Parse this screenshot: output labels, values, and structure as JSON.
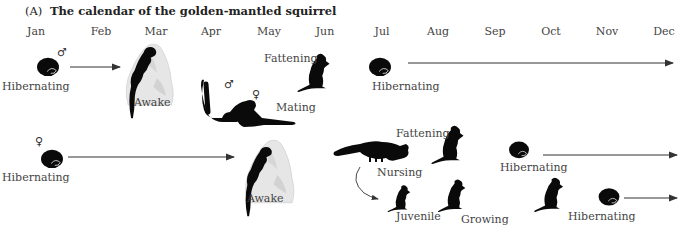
{
  "figure": {
    "panel_label": "(A)",
    "title": "The calendar of the golden-mantled squirrel"
  },
  "months": [
    "Jan",
    "Feb",
    "Mar",
    "Apr",
    "May",
    "Jun",
    "Jul",
    "Aug",
    "Sep",
    "Oct",
    "Nov",
    "Dec"
  ],
  "male_row": {
    "sex_symbol": "♂",
    "stages": {
      "hibernating_start": "Hibernating",
      "awake": "Awake",
      "mating": "Mating",
      "fattening": "Fattening",
      "hibernating_end": "Hibernating"
    },
    "mating_symbols": {
      "male": "♂",
      "female": "♀"
    }
  },
  "female_row": {
    "sex_symbol": "♀",
    "stages": {
      "hibernating_start": "Hibernating",
      "awake": "Awake",
      "nursing": "Nursing",
      "fattening": "Fattening",
      "hibernating_end": "Hibernating"
    }
  },
  "juvenile_row": {
    "stages": {
      "juvenile": "Juvenile",
      "growing": "Growing",
      "hibernating": "Hibernating"
    }
  },
  "colors": {
    "squirrel": "#0a0a0a",
    "rock": "#e4e4e4",
    "arrow": "#333333",
    "text": "#444444"
  }
}
